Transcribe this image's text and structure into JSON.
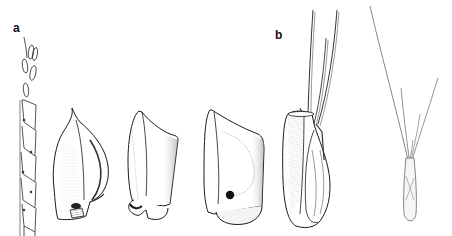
{
  "figure": {
    "panels": [
      {
        "label": "a"
      },
      {
        "label": "b"
      }
    ],
    "colors": {
      "background": "#ffffff",
      "ink": "#1a1a1a",
      "shade": "#9a9a9a",
      "awn": "#6f6f6f"
    }
  }
}
